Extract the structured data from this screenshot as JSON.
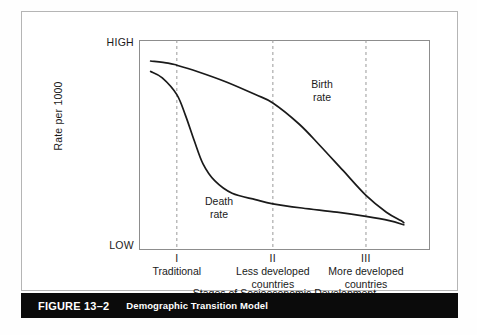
{
  "caption": {
    "figure_number": "FIGURE 13–2",
    "title": "Demographic Transition Model"
  },
  "axes": {
    "y_axis_label": "Rate per 1000",
    "y_high_label": "HIGH",
    "y_low_label": "LOW",
    "x_axis_label": "Stages of Socioeconomic Development"
  },
  "stages": [
    {
      "numeral": "I",
      "name": "Traditional"
    },
    {
      "numeral": "II",
      "name": "Less developed\ncountries"
    },
    {
      "numeral": "III",
      "name": "More developed\ncountries"
    }
  ],
  "annotations": {
    "birth": "Birth\nrate",
    "death": "Death\nrate"
  },
  "colors": {
    "curve": "#1a1a1a",
    "frame": "#8d8d8d",
    "card_border": "#b5b5b5",
    "gridline": "#9a9a9a",
    "caption_bar": "#0b0b0b",
    "caption_text": "#ffffff",
    "page_background": "#ffffff"
  },
  "chart_data": {
    "type": "line",
    "title": "Demographic Transition Model",
    "xlabel": "Stages of Socioeconomic Development",
    "ylabel": "Rate per 1000",
    "xlim": [
      0,
      100
    ],
    "ylim": [
      0,
      100
    ],
    "ytick_labels": [
      "LOW",
      "HIGH"
    ],
    "ytick_values": [
      0,
      100
    ],
    "xtick_labels": [
      "I",
      "II",
      "III"
    ],
    "xtick_values": [
      13,
      46,
      78
    ],
    "grid": "vertical dashed gridlines at stage boundaries",
    "legend": "inline curve labels",
    "series": [
      {
        "name": "Birth rate",
        "x": [
          4,
          10,
          13,
          20,
          30,
          40,
          46,
          55,
          62,
          70,
          78,
          85,
          90,
          91
        ],
        "values": [
          90,
          89,
          88,
          85,
          80,
          74,
          70,
          60,
          50,
          38,
          26,
          18,
          14,
          13
        ]
      },
      {
        "name": "Death rate",
        "x": [
          4,
          8,
          13,
          16,
          19,
          22,
          26,
          32,
          40,
          46,
          56,
          68,
          78,
          86,
          91
        ],
        "values": [
          85,
          82,
          74,
          64,
          52,
          41,
          33,
          27,
          24,
          22,
          20,
          18,
          16,
          14,
          12
        ]
      }
    ]
  }
}
